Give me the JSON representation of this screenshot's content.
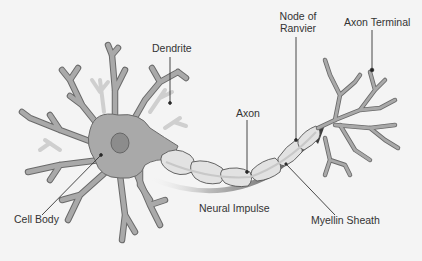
{
  "diagram": {
    "labels": {
      "dendrite": "Dendrite",
      "cell_body": "Cell Body",
      "axon": "Axon",
      "node_of_ranvier_line1": "Node of",
      "node_of_ranvier_line2": "Ranvier",
      "axon_terminal": "Axon Terminal",
      "neural_impulse": "Neural Impulse",
      "myelin_sheath": "Myellin Sheath"
    },
    "colors": {
      "background": "#f4f4f4",
      "cell_fill": "#a9a9a9",
      "cell_outline": "#6a6a6a",
      "nucleus": "#8c8c8c",
      "faint_dendrite": "#cfcfcf",
      "myelin_fill": "#e2e2e2",
      "impulse_arrow": "#5a5a5a",
      "leader_line": "#333333"
    }
  }
}
